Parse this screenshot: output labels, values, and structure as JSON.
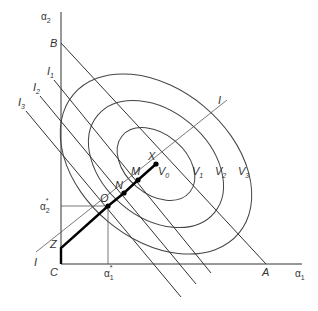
{
  "diagram": {
    "axes": {
      "x_label": "α",
      "x_label_sub": "1",
      "y_label": "α",
      "y_label_sub": "2"
    },
    "points": {
      "origin": "C",
      "x_intercept": "A",
      "y_intercept": "B",
      "Z": "Z",
      "O": "O",
      "N": "N",
      "M": "M",
      "X": "X"
    },
    "optimum_labels": {
      "alpha1_star": "α",
      "alpha1_star_sub": "1",
      "alpha2_star": "α",
      "alpha2_star_sub": "2",
      "star": "*"
    },
    "iso_lines": [
      {
        "label": "I",
        "sub": "1"
      },
      {
        "label": "I",
        "sub": "2"
      },
      {
        "label": "I",
        "sub": "3"
      }
    ],
    "expansion_path_label": "I",
    "contours": [
      {
        "label": "V",
        "sub": "0"
      },
      {
        "label": "V",
        "sub": "1"
      },
      {
        "label": "V",
        "sub": "2"
      },
      {
        "label": "V",
        "sub": "3"
      }
    ]
  }
}
